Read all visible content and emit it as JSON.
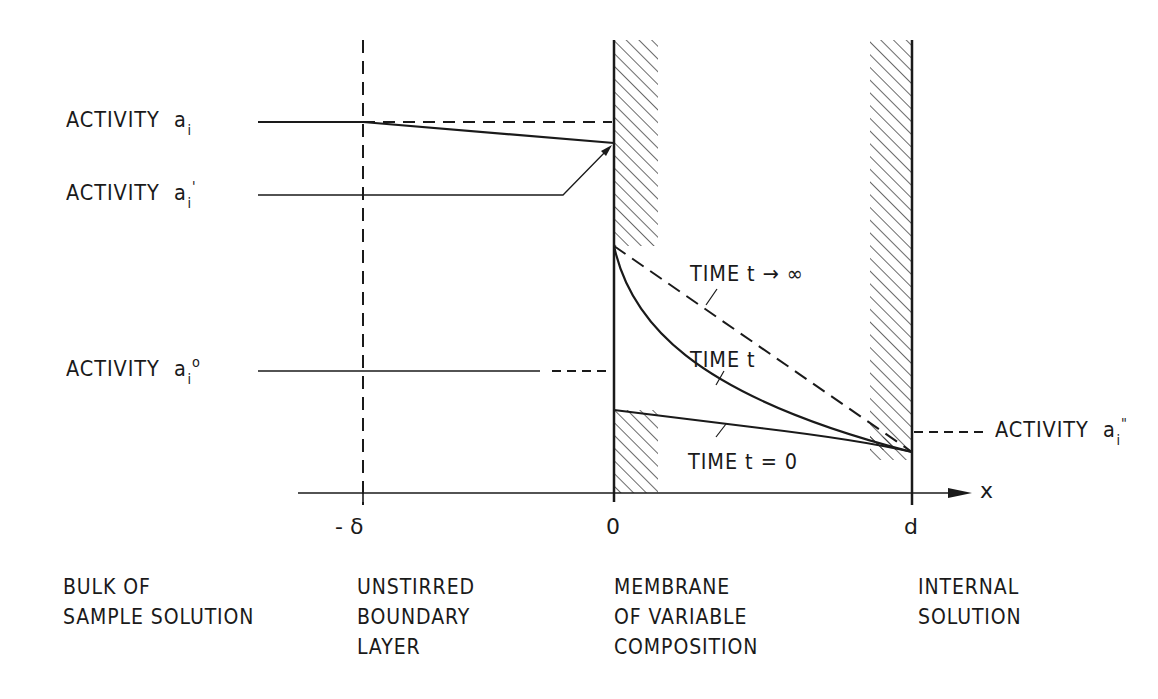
{
  "labels": {
    "activity_bulk": {
      "text": "ACTIVITY",
      "symbol": "a",
      "sub": "i",
      "sup": ""
    },
    "activity_boundary": {
      "text": "ACTIVITY",
      "symbol": "a",
      "sub": "i",
      "sup": "'"
    },
    "activity_surface": {
      "text": "ACTIVITY",
      "symbol": "a",
      "sub": "i",
      "sup": "o"
    },
    "activity_internal": {
      "text": "ACTIVITY",
      "symbol": "a",
      "sub": "i",
      "sup": "\""
    }
  },
  "curves": {
    "t_inf": "TIME t → ∞",
    "t": "TIME t",
    "t0": "TIME t = 0"
  },
  "axis": {
    "x_label": "x",
    "ticks": [
      "- δ",
      "0",
      "d"
    ]
  },
  "regions": [
    {
      "lines": [
        "BULK  OF",
        "SAMPLE  SOLUTION"
      ]
    },
    {
      "lines": [
        "UNSTIRRED",
        "BOUNDARY",
        "LAYER"
      ]
    },
    {
      "lines": [
        "MEMBRANE",
        "OF  VARIABLE",
        "COMPOSITION"
      ]
    },
    {
      "lines": [
        "INTERNAL",
        "SOLUTION"
      ]
    }
  ],
  "colors": {
    "ink": "#1a1a1a",
    "paper": "#ffffff"
  }
}
